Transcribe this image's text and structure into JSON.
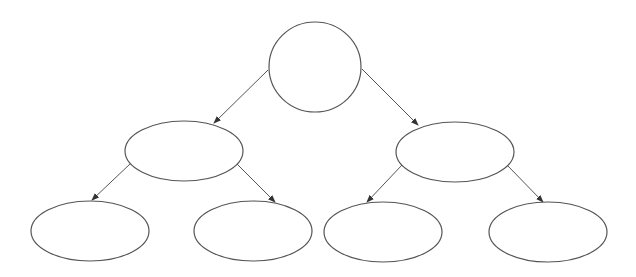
{
  "diagram": {
    "type": "binary-tree",
    "stroke_color": "#555555",
    "fill_color": "#ffffff",
    "background": "#ffffff",
    "nodes": [
      {
        "id": "root",
        "shape": "circle",
        "cx": 315,
        "cy": 67,
        "rx": 46,
        "ry": 45,
        "label": ""
      },
      {
        "id": "left",
        "shape": "ellipse",
        "cx": 184,
        "cy": 151,
        "rx": 59,
        "ry": 30,
        "label": ""
      },
      {
        "id": "right",
        "shape": "ellipse",
        "cx": 455,
        "cy": 152,
        "rx": 59,
        "ry": 30,
        "label": ""
      },
      {
        "id": "left-left",
        "shape": "ellipse",
        "cx": 90,
        "cy": 231,
        "rx": 59,
        "ry": 30,
        "label": ""
      },
      {
        "id": "left-right",
        "shape": "ellipse",
        "cx": 253,
        "cy": 231,
        "rx": 59,
        "ry": 30,
        "label": ""
      },
      {
        "id": "right-left",
        "shape": "ellipse",
        "cx": 383,
        "cy": 232,
        "rx": 59,
        "ry": 30,
        "label": ""
      },
      {
        "id": "right-right",
        "shape": "ellipse",
        "cx": 548,
        "cy": 232,
        "rx": 59,
        "ry": 30,
        "label": ""
      }
    ],
    "edges": [
      {
        "from": "root",
        "to": "left",
        "x1": 268,
        "y1": 70,
        "x2": 214,
        "y2": 123
      },
      {
        "from": "root",
        "to": "right",
        "x1": 362,
        "y1": 69,
        "x2": 418,
        "y2": 125
      },
      {
        "from": "left",
        "to": "left-left",
        "x1": 130,
        "y1": 164,
        "x2": 92,
        "y2": 200
      },
      {
        "from": "left",
        "to": "left-right",
        "x1": 237,
        "y1": 164,
        "x2": 275,
        "y2": 202
      },
      {
        "from": "right",
        "to": "right-left",
        "x1": 402,
        "y1": 165,
        "x2": 367,
        "y2": 202
      },
      {
        "from": "right",
        "to": "right-right",
        "x1": 507,
        "y1": 165,
        "x2": 543,
        "y2": 202
      }
    ]
  }
}
